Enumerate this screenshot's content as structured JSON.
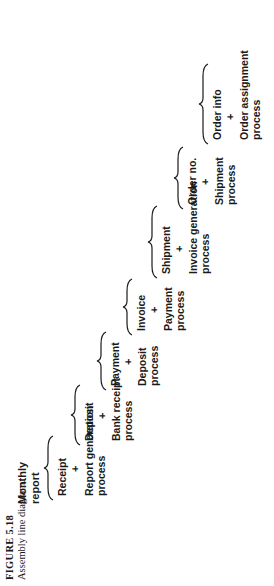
{
  "diagram": {
    "title": "Assembly line diagram",
    "final_output": "Monthly report",
    "final_output_lines": [
      "Monthly",
      "report"
    ],
    "stages": [
      {
        "input": "Receipt",
        "operator": "+",
        "process_lines": [
          "Report generation",
          "process"
        ]
      },
      {
        "input": "Deposit",
        "operator": "+",
        "process_lines": [
          "Bank receipt",
          "process"
        ]
      },
      {
        "input": "Payment",
        "operator": "+",
        "process_lines": [
          "Deposit",
          "process"
        ]
      },
      {
        "input": "Invoice",
        "operator": "+",
        "process_lines": [
          "Payment",
          "process"
        ]
      },
      {
        "input": "Shipment",
        "operator": "+",
        "process_lines": [
          "Invoice generation",
          "process"
        ]
      },
      {
        "input": "Order no.",
        "operator": "+",
        "process_lines": [
          "Shipment",
          "process"
        ]
      },
      {
        "input": "Order info",
        "operator": "+",
        "process_lines": [
          "Order assignment",
          "process"
        ]
      }
    ]
  },
  "caption": {
    "figure_number": "FIGURE 5.18",
    "text": "Assembly line diagram."
  }
}
